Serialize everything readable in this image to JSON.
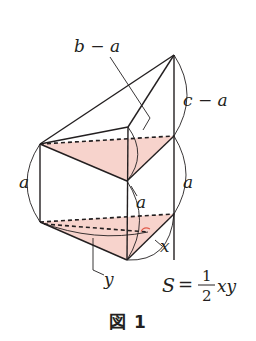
{
  "figure": {
    "caption": "図 1",
    "colors": {
      "stroke": "#231f20",
      "fill_shaded": "#f7d3cc",
      "right_angle_mark": "#e05a4a",
      "background": "#ffffff"
    },
    "vertices": {
      "apex": [
        174,
        55
      ],
      "top_left": [
        40,
        144
      ],
      "top_mid_back": [
        128,
        127
      ],
      "top_right": [
        174,
        136
      ],
      "mid_front": [
        127,
        181
      ],
      "bottom_left": [
        40,
        222
      ],
      "bottom_right": [
        174,
        214
      ],
      "bottom_front": [
        127,
        260
      ],
      "altitude_foot": [
        148,
        232
      ]
    },
    "labels": {
      "b_minus_a": "b − a",
      "c_minus_a": "c − a",
      "left_height": "a",
      "middle_height": "a",
      "right_height": "a",
      "x": "x",
      "y": "y"
    },
    "formula": {
      "lhs": "S",
      "equals": "=",
      "numerator": "1",
      "denominator": "2",
      "rhs": "xy"
    }
  }
}
